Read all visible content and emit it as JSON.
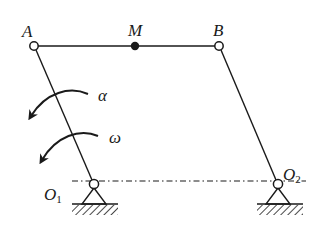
{
  "diagram": {
    "type": "four-bar linkage (parallelogram mechanism)",
    "stroke_color": "#1a1a1a",
    "background": "#ffffff",
    "points": {
      "A": {
        "label": "A",
        "x": 34,
        "y": 46,
        "marker": "hollow-pin"
      },
      "M": {
        "label": "M",
        "x": 135,
        "y": 46,
        "marker": "filled-dot"
      },
      "B": {
        "label": "B",
        "x": 219,
        "y": 46,
        "marker": "hollow-pin"
      },
      "O1": {
        "label": "O",
        "subscript": "1",
        "x": 94,
        "y": 184,
        "marker": "fixed-support"
      },
      "O2": {
        "label": "O",
        "subscript": "2",
        "x": 278,
        "y": 184,
        "marker": "fixed-support"
      }
    },
    "links": [
      {
        "name": "AB",
        "from": "A",
        "to": "B"
      },
      {
        "name": "O1A",
        "from": "O1",
        "to": "A"
      },
      {
        "name": "O2B",
        "from": "O2",
        "to": "B"
      }
    ],
    "baseline": {
      "style": "dash-dot",
      "from": "O1",
      "to": "O2"
    },
    "annotations": {
      "alpha": {
        "symbol": "α",
        "meaning": "angular acceleration",
        "direction": "counterclockwise"
      },
      "omega": {
        "symbol": "ω",
        "meaning": "angular velocity",
        "direction": "counterclockwise"
      }
    }
  }
}
